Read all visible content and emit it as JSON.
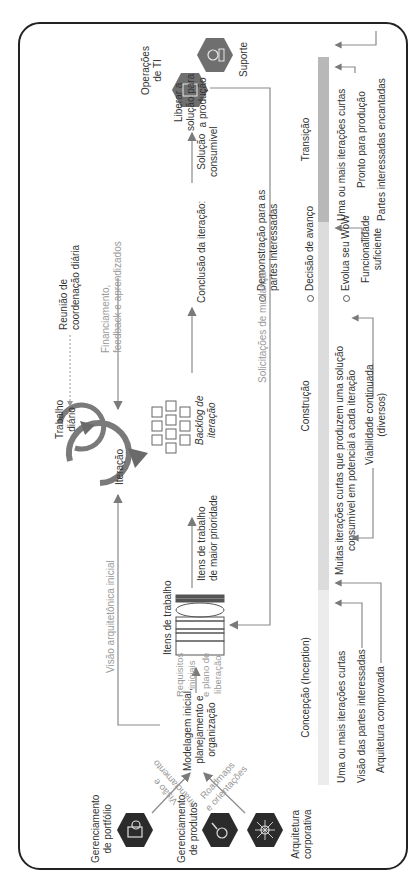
{
  "orientation": "rotated -90deg (landscape diagram shown in portrait)",
  "actors": {
    "portfolio": "Gerenciamento\nde portfólio",
    "products": "Gerenciamento\nde produtos",
    "architecture": "Arquitetura\ncorporativa",
    "it_ops": "Operações\nde TI",
    "support": "Suporte"
  },
  "flows": {
    "vision_funding": "Visão e\nfinanciamento",
    "roadmaps": "Roadmaps\ne orientações",
    "initial_modeling": "Modelagem inicial,\nplanejamento e\norganização",
    "initial_arch_vision": "Visão arquitetônica inicial",
    "initial_requirements": "Requisitos\niniciais",
    "release_plan": "e plano de\nliberação",
    "work_items": "Itens de trabalho",
    "highest_priority": "Itens de trabalho\nde maior prioridade",
    "iteration_backlog": "Backlog de\niteração",
    "iteration": "Iteração",
    "daily_work": "Trabalho\ndiário",
    "daily_meeting": "Reunião de\ncoordenação diária",
    "funding_feedback": "Financiamento,\nfeedback e aprendizados",
    "iteration_conclusion_title": "Conclusão da iteração:",
    "iteration_conclusion_items": [
      "Demonstração para as\npartes interessadas",
      "Decisão de avanço",
      "Evolua seu WoW"
    ],
    "consumable_solution": "Solução\nconsumível",
    "release_to_production": "Liberar a\nsolução para\na produção",
    "change_requests": "Solicitações de mudança"
  },
  "phases": [
    {
      "name": "Concepção (Inception)",
      "color": "#ececec",
      "description": "Uma ou mais iterações curtas",
      "milestones": [
        "Visão das partes interessadas",
        "Arquitetura comprovada"
      ]
    },
    {
      "name": "Construção",
      "color": "#dcdcdc",
      "description": "Muitas iterações curtas que produzem uma solução\nconsumível em potencial a cada iteração",
      "milestones": [
        "Viabilidade continuada\n(diversos)",
        "Funcionalidade\nsuficiente"
      ]
    },
    {
      "name": "Transição",
      "color": "#b8b8b8",
      "description": "Uma ou mais iterações curtas",
      "milestones": [
        "Pronto para produção",
        "Partes interessadas encantadas"
      ]
    }
  ],
  "colors": {
    "hex_dark": "#2b2b2b",
    "hex_grey": "#6f6f6f",
    "arrow": "#7a7a7a",
    "line": "#8a8a8a"
  }
}
